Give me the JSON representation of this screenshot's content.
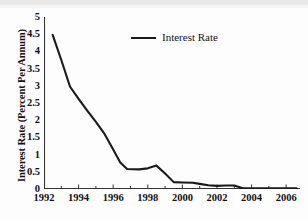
{
  "chart_data": {
    "type": "line",
    "title": "",
    "xlabel": "",
    "ylabel": "Interest Rate (Percent Per Annum)",
    "xlim": [
      1992,
      2006.8
    ],
    "ylim": [
      0,
      5
    ],
    "grid": false,
    "legend_position": "top-center",
    "x_ticks_major": [
      "1992",
      "1994",
      "1996",
      "1998",
      "2000",
      "2002",
      "2004",
      "2006"
    ],
    "x_tick_values_major": [
      1992,
      1994,
      1996,
      1998,
      2000,
      2002,
      2004,
      2006
    ],
    "x_tick_values_minor": [
      1993,
      1995,
      1997,
      1999,
      2001,
      2003,
      2005
    ],
    "y_ticks": [
      "0",
      "0.5",
      "1",
      "1.5",
      "2",
      "2.5",
      "3",
      "3.5",
      "4",
      "4.5",
      "5"
    ],
    "y_tick_values": [
      0,
      0.5,
      1,
      1.5,
      2,
      2.5,
      3,
      3.5,
      4,
      4.5,
      5
    ],
    "series": [
      {
        "name": "Interest Rate",
        "color": "#1a1a1a",
        "x": [
          1992.5,
          1993.0,
          1993.5,
          1994.0,
          1994.5,
          1995.0,
          1995.5,
          1996.0,
          1996.4,
          1996.8,
          1997.5,
          1998.0,
          1998.5,
          1999.0,
          1999.5,
          2000.0,
          2000.6,
          2001.0,
          2001.5,
          2002.0,
          2002.5,
          2003.0,
          2003.5,
          2004.0,
          2005.0,
          2006.0,
          2006.6
        ],
        "y": [
          4.48,
          3.75,
          2.98,
          2.62,
          2.28,
          1.95,
          1.6,
          1.15,
          0.78,
          0.58,
          0.57,
          0.6,
          0.68,
          0.45,
          0.2,
          0.19,
          0.18,
          0.15,
          0.11,
          0.09,
          0.1,
          0.1,
          0.02,
          0.02,
          0.02,
          0.02,
          0.02
        ]
      }
    ]
  },
  "legend": {
    "entries": [
      {
        "label": "Interest Rate"
      }
    ]
  }
}
